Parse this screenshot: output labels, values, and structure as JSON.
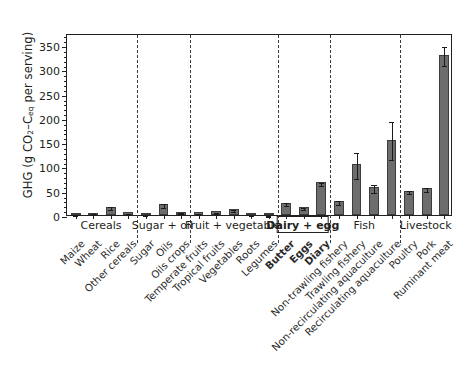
{
  "chart_data": {
    "type": "bar",
    "title": "",
    "xlabel": "",
    "ylabel": "GHG (g CO2–Ceq per serving)",
    "ylabel_parts": {
      "prefix": "GHG (g CO",
      "sub1": "2",
      "mid": "–C",
      "sub2": "eq",
      "suffix": " per serving)"
    },
    "ylim": [
      0,
      375
    ],
    "yticks": [
      0,
      50,
      100,
      150,
      200,
      250,
      300,
      350
    ],
    "ytick_labels": [
      "0",
      "50",
      "100",
      "150",
      "200",
      "250",
      "300",
      "350"
    ],
    "grid": false,
    "legend": "none",
    "categories": [
      "Maize",
      "Wheat",
      "Rice",
      "Other cereals",
      "Sugar",
      "Oils",
      "Oils crops",
      "Temperate fruits",
      "Tropical fruits",
      "Vegetables",
      "Roots",
      "Legumes",
      "Butter",
      "Eggs",
      "Diary",
      "Non-trawling fishery",
      "Trawling fishery",
      "Non-recirculating aquaculture",
      "Recirculating aquaculture",
      "Poultry",
      "Pork",
      "Ruminant meat"
    ],
    "bold_categories": [
      "Butter",
      "Eggs",
      "Diary"
    ],
    "values": [
      3,
      5,
      17,
      6,
      2,
      22,
      7,
      6,
      8,
      12,
      2,
      1,
      25,
      17,
      67,
      28,
      105,
      58,
      155,
      50,
      55,
      330
    ],
    "err_low": [
      2,
      4,
      14,
      5,
      1.5,
      18,
      6,
      5,
      7,
      10,
      1.5,
      0.8,
      22,
      15,
      63,
      24,
      78,
      50,
      118,
      47,
      51,
      312
    ],
    "err_high": [
      4,
      6,
      20,
      7,
      2.5,
      26,
      8,
      7,
      9,
      14,
      2.5,
      1.3,
      28,
      19,
      71,
      32,
      131,
      66,
      195,
      53,
      59,
      350
    ],
    "groups": [
      {
        "label": "Cereals",
        "start": 0,
        "end": 3,
        "boxed": false
      },
      {
        "label": "Sugar + oil",
        "start": 4,
        "end": 6,
        "boxed": false
      },
      {
        "label": "Fruit + vegetable",
        "start": 7,
        "end": 11,
        "boxed": false
      },
      {
        "label": "Dairy + egg",
        "start": 12,
        "end": 14,
        "boxed": true
      },
      {
        "label": "Fish",
        "start": 15,
        "end": 18,
        "boxed": false
      },
      {
        "label": "Livestock",
        "start": 19,
        "end": 21,
        "boxed": false
      }
    ],
    "colors": {
      "bar_fill": "#6d6d6d",
      "bar_edge": "#3c3c3c",
      "axis": "#231f20",
      "error": "#1a1a1a",
      "separator": "#3a3a3a",
      "background": "#ffffff"
    }
  }
}
